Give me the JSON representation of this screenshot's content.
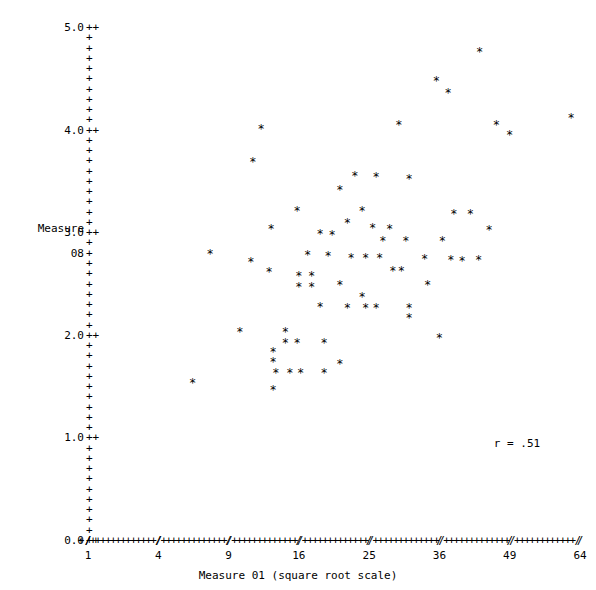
{
  "chart_data": {
    "type": "scatter",
    "title": "",
    "xlabel": "Measure 01 (square root scale)",
    "ylabel": "Measure 08",
    "ylabel_lines": [
      "Measure",
      "08"
    ],
    "annotation": "r = .51",
    "correlation": 0.51,
    "marker": "*",
    "axis_glyph_minor": "+",
    "axis_glyph_major": "++",
    "axis_glyph_xtick": "/",
    "grid": false,
    "legend": null,
    "xscale": "sqrt",
    "xlim": [
      1,
      64
    ],
    "ylim": [
      0.0,
      5.0
    ],
    "xticks": [
      1,
      4,
      9,
      16,
      25,
      36,
      49,
      64
    ],
    "xtick_labels": [
      "1",
      "4",
      "9",
      "16",
      "25",
      "36",
      "49",
      "64"
    ],
    "yticks": [
      0.0,
      1.0,
      2.0,
      3.0,
      4.0,
      5.0
    ],
    "ytick_labels": [
      "0.0",
      "1.0",
      "2.0",
      "3.0",
      "4.0",
      "5.0"
    ],
    "y_minor_per_major": 10,
    "points": [
      {
        "x": 43.2,
        "y": 4.77
      },
      {
        "x": 35.5,
        "y": 4.48
      },
      {
        "x": 37.5,
        "y": 4.37
      },
      {
        "x": 29.4,
        "y": 4.05
      },
      {
        "x": 46.4,
        "y": 4.05
      },
      {
        "x": 12.0,
        "y": 4.02
      },
      {
        "x": 62.0,
        "y": 4.12
      },
      {
        "x": 49.0,
        "y": 3.96
      },
      {
        "x": 11.2,
        "y": 3.69
      },
      {
        "x": 23.0,
        "y": 3.56
      },
      {
        "x": 26.0,
        "y": 3.55
      },
      {
        "x": 31.0,
        "y": 3.53
      },
      {
        "x": 15.8,
        "y": 3.22
      },
      {
        "x": 24.0,
        "y": 3.22
      },
      {
        "x": 38.5,
        "y": 3.19
      },
      {
        "x": 41.5,
        "y": 3.19
      },
      {
        "x": 22.0,
        "y": 3.1
      },
      {
        "x": 25.5,
        "y": 3.05
      },
      {
        "x": 28.0,
        "y": 3.04
      },
      {
        "x": 45.0,
        "y": 3.03
      },
      {
        "x": 18.5,
        "y": 2.99
      },
      {
        "x": 20.0,
        "y": 2.98
      },
      {
        "x": 27.0,
        "y": 2.92
      },
      {
        "x": 30.5,
        "y": 2.92
      },
      {
        "x": 36.5,
        "y": 2.92
      },
      {
        "x": 7.5,
        "y": 2.8
      },
      {
        "x": 17.0,
        "y": 2.79
      },
      {
        "x": 19.5,
        "y": 2.78
      },
      {
        "x": 22.5,
        "y": 2.76
      },
      {
        "x": 24.5,
        "y": 2.76
      },
      {
        "x": 26.5,
        "y": 2.76
      },
      {
        "x": 33.5,
        "y": 2.75
      },
      {
        "x": 38.0,
        "y": 2.74
      },
      {
        "x": 11.0,
        "y": 2.72
      },
      {
        "x": 28.5,
        "y": 2.63
      },
      {
        "x": 29.8,
        "y": 2.63
      },
      {
        "x": 16.0,
        "y": 2.58
      },
      {
        "x": 17.5,
        "y": 2.58
      },
      {
        "x": 16.0,
        "y": 2.48
      },
      {
        "x": 17.5,
        "y": 2.48
      },
      {
        "x": 24.0,
        "y": 2.38
      },
      {
        "x": 18.5,
        "y": 2.28
      },
      {
        "x": 22.0,
        "y": 2.27
      },
      {
        "x": 24.5,
        "y": 2.27
      },
      {
        "x": 26.0,
        "y": 2.27
      },
      {
        "x": 31.0,
        "y": 2.27
      },
      {
        "x": 31.0,
        "y": 2.17
      },
      {
        "x": 10.0,
        "y": 2.04
      },
      {
        "x": 14.5,
        "y": 2.04
      },
      {
        "x": 36.0,
        "y": 1.98
      },
      {
        "x": 14.5,
        "y": 1.93
      },
      {
        "x": 15.8,
        "y": 1.93
      },
      {
        "x": 19.0,
        "y": 1.93
      },
      {
        "x": 13.2,
        "y": 1.84
      },
      {
        "x": 13.2,
        "y": 1.74
      },
      {
        "x": 21.0,
        "y": 1.73
      },
      {
        "x": 13.5,
        "y": 1.64
      },
      {
        "x": 15.0,
        "y": 1.64
      },
      {
        "x": 16.2,
        "y": 1.64
      },
      {
        "x": 19.0,
        "y": 1.64
      },
      {
        "x": 6.2,
        "y": 1.54
      },
      {
        "x": 13.2,
        "y": 1.47
      },
      {
        "x": 12.8,
        "y": 2.62
      },
      {
        "x": 13.0,
        "y": 3.04
      },
      {
        "x": 21.0,
        "y": 2.5
      },
      {
        "x": 34.0,
        "y": 2.5
      },
      {
        "x": 40.0,
        "y": 2.73
      },
      {
        "x": 43.0,
        "y": 2.74
      },
      {
        "x": 21.0,
        "y": 3.42
      }
    ]
  },
  "axis": {
    "x_title": "Measure 01 (square root scale)",
    "y_title_line1": "Measure",
    "y_title_line2": "08"
  },
  "annotation": {
    "text": "r = .51"
  },
  "glyphs": {
    "minor_tick": "+",
    "major_tick": "++",
    "x_tick_mark": "/",
    "point_marker": "*"
  }
}
